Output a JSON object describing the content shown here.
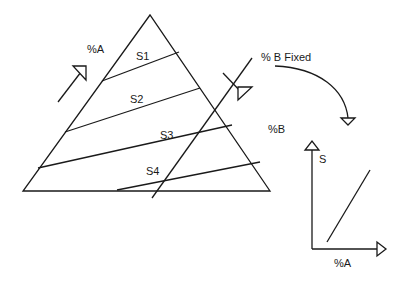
{
  "diagram": {
    "type": "ternary-phase-diagram-schematic",
    "triangle": {
      "labels": {
        "percent_a": "%A",
        "percent_b": "%B"
      },
      "tie_lines": [
        {
          "label": "S1"
        },
        {
          "label": "S2"
        },
        {
          "label": "S3"
        },
        {
          "label": "S4"
        }
      ],
      "fixed_line_label": "% B Fixed"
    },
    "inset_plot": {
      "y_label": "S",
      "x_label": "%A"
    },
    "colors": {
      "stroke": "#1a1a1a",
      "background": "#ffffff"
    }
  }
}
